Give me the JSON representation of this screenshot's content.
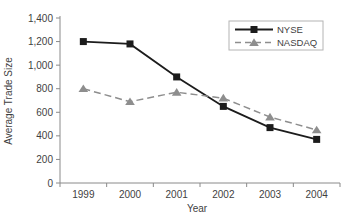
{
  "chart_data": {
    "type": "line",
    "title": "",
    "xlabel": "Year",
    "ylabel": "Average Trade Size",
    "categories": [
      "1999",
      "2000",
      "2001",
      "2002",
      "2003",
      "2004"
    ],
    "series": [
      {
        "name": "NYSE",
        "values": [
          1200,
          1180,
          900,
          650,
          470,
          370
        ],
        "color": "#1c1c1c",
        "line_style": "solid",
        "marker": "square"
      },
      {
        "name": "NASDAQ",
        "values": [
          800,
          690,
          770,
          720,
          560,
          450
        ],
        "color": "#8e8e8e",
        "line_style": "dashed",
        "marker": "triangle"
      }
    ],
    "ylim": [
      0,
      1400
    ],
    "ytick_step": 200,
    "ytick_labels": [
      "0",
      "200",
      "400",
      "600",
      "800",
      "1,000",
      "1,200",
      "1,400"
    ],
    "grid": false,
    "legend_position": "top-right",
    "axis_color": "#8a8a8a",
    "text_color": "#3f3f3f",
    "legend_border_color": "#b4b4b4"
  }
}
